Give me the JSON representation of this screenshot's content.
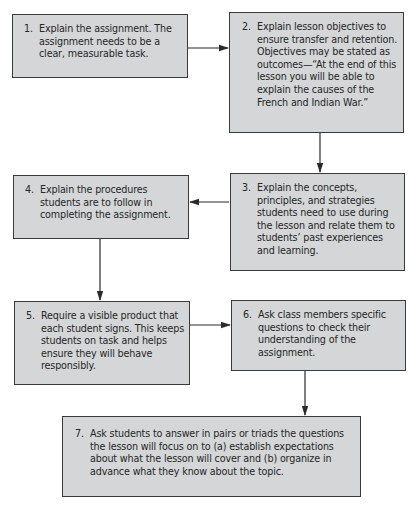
{
  "diagram": {
    "type": "flowchart",
    "steps": [
      {
        "number": "1.",
        "text": "Explain the assignment. The assignment needs to be a clear, measurable task."
      },
      {
        "number": "2.",
        "text": "Explain lesson objectives to ensure transfer and retention. Objectives may be stated as outcomes—“At the end of this lesson you will be able to explain the causes of the French and Indian War.”"
      },
      {
        "number": "3.",
        "text": "Explain the concepts, principles, and strategies students need to use during the lesson and relate them to students’ past experiences and learning."
      },
      {
        "number": "4.",
        "text": "Explain the procedures students are to follow in completing the assignment."
      },
      {
        "number": "5.",
        "text": "Require a visible product that each student signs. This keeps students on task and helps ensure they will behave responsibly."
      },
      {
        "number": "6.",
        "text": "Ask class members specific questions to check their understanding of the assignment."
      },
      {
        "number": "7.",
        "text": "Ask students to answer in pairs or triads the questions the lesson will focus on to (a) establish expectations about what the lesson will cover and (b) organize in advance what they know about the topic."
      }
    ],
    "connections": [
      {
        "from": "1",
        "to": "2",
        "direction": "right"
      },
      {
        "from": "2",
        "to": "3",
        "direction": "down"
      },
      {
        "from": "3",
        "to": "4",
        "direction": "left"
      },
      {
        "from": "4",
        "to": "5",
        "direction": "down"
      },
      {
        "from": "5",
        "to": "6",
        "direction": "right"
      },
      {
        "from": "6",
        "to": "7",
        "direction": "down"
      }
    ],
    "colors": {
      "box_fill": "#d4d6d8",
      "box_border": "#3a3a3a",
      "arrow": "#2a2a2a",
      "text": "#262626"
    }
  }
}
